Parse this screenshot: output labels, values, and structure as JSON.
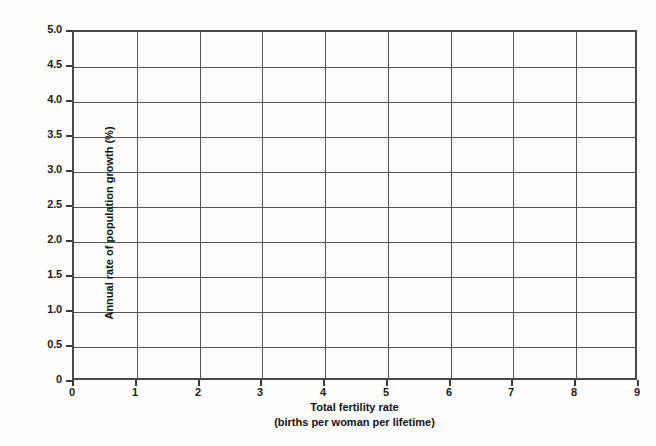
{
  "chart_data": {
    "type": "line",
    "title": "",
    "subtitle": "",
    "xlabel": "Total fertility rate",
    "xlabel_sub": "(births per woman per lifetime)",
    "ylabel": "Annual rate of population growth (%)",
    "xlim": [
      0,
      9
    ],
    "ylim": [
      0,
      5.0
    ],
    "x_tick_labels": [
      "0",
      "1",
      "2",
      "3",
      "4",
      "5",
      "6",
      "7",
      "8",
      "9"
    ],
    "x_tick_values": [
      0,
      1,
      2,
      3,
      4,
      5,
      6,
      7,
      8,
      9
    ],
    "y_tick_labels": [
      "0",
      "0.5",
      "1.0",
      "1.5",
      "2.0",
      "2.5",
      "3.0",
      "3.5",
      "4.0",
      "4.5",
      "5.0"
    ],
    "y_tick_values": [
      0,
      0.5,
      1.0,
      1.5,
      2.0,
      2.5,
      3.0,
      3.5,
      4.0,
      4.5,
      5.0
    ],
    "grid": true,
    "grid_color": "#555555",
    "axis_color": "#4a4a4a",
    "background_color": "#fdfdfd",
    "legend": [],
    "legend_position": "none",
    "annotations": [],
    "series": [],
    "values": [],
    "categories": [],
    "note": "Blank grid worksheet — no data series plotted"
  }
}
